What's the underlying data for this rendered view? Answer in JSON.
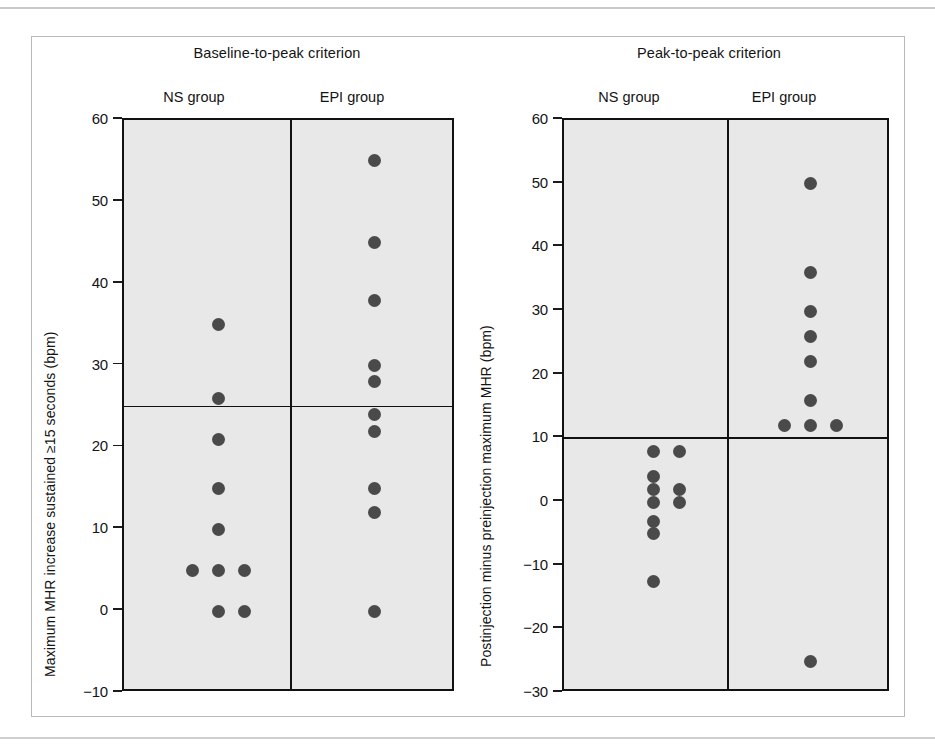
{
  "figure": {
    "panels": [
      {
        "id": "baseline-to-peak",
        "title": "Baseline-to-peak criterion",
        "axis_title": "Maximum MHR increase sustained ≥15 seconds (bpm)",
        "groups": [
          "NS group",
          "EPI group"
        ],
        "tick_labels": [
          "60",
          "50",
          "40",
          "30",
          "20",
          "10",
          "0",
          "−10"
        ],
        "threshold_label": "25"
      },
      {
        "id": "peak-to-peak",
        "title": "Peak-to-peak criterion",
        "axis_title": "Postinjection minus preinjection maximum MHR (bpm)",
        "groups": [
          "NS group",
          "EPI group"
        ],
        "tick_labels": [
          "60",
          "50",
          "40",
          "30",
          "20",
          "10",
          "0",
          "−10",
          "−20",
          "−30"
        ],
        "threshold_label": "10"
      }
    ]
  },
  "chart_data": [
    {
      "type": "scatter",
      "title": "Baseline-to-peak criterion",
      "xlabel": "",
      "ylabel": "Maximum MHR increase sustained ≥15 seconds (bpm)",
      "ylim": [
        -10,
        60
      ],
      "yticks": [
        -10,
        0,
        10,
        20,
        30,
        40,
        50,
        60
      ],
      "grid": false,
      "legend": "none",
      "threshold_line": 25,
      "categories": [
        "NS group",
        "EPI group"
      ],
      "series": [
        {
          "name": "NS group",
          "values": [
            35,
            26,
            21,
            15,
            10,
            5,
            5,
            5,
            0,
            0
          ],
          "points": [
            {
              "value": 35,
              "offset": 0
            },
            {
              "value": 26,
              "offset": 0
            },
            {
              "value": 21,
              "offset": 0
            },
            {
              "value": 15,
              "offset": 0
            },
            {
              "value": 10,
              "offset": 0
            },
            {
              "value": 5,
              "offset": -1
            },
            {
              "value": 5,
              "offset": 0
            },
            {
              "value": 5,
              "offset": 1
            },
            {
              "value": 0,
              "offset": 0
            },
            {
              "value": 0,
              "offset": 1
            }
          ]
        },
        {
          "name": "EPI group",
          "values": [
            55,
            45,
            38,
            30,
            28,
            24,
            22,
            15,
            12,
            0
          ],
          "points": [
            {
              "value": 55,
              "offset": 0
            },
            {
              "value": 45,
              "offset": 0
            },
            {
              "value": 38,
              "offset": 0
            },
            {
              "value": 30,
              "offset": 0
            },
            {
              "value": 28,
              "offset": 0
            },
            {
              "value": 24,
              "offset": 0
            },
            {
              "value": 22,
              "offset": 0
            },
            {
              "value": 15,
              "offset": 0
            },
            {
              "value": 12,
              "offset": 0
            },
            {
              "value": 0,
              "offset": 0
            }
          ]
        }
      ]
    },
    {
      "type": "scatter",
      "title": "Peak-to-peak criterion",
      "xlabel": "",
      "ylabel": "Postinjection minus preinjection maximum MHR (bpm)",
      "ylim": [
        -30,
        60
      ],
      "yticks": [
        -30,
        -20,
        -10,
        0,
        10,
        20,
        30,
        40,
        50,
        60
      ],
      "grid": false,
      "legend": "none",
      "threshold_line": 10,
      "categories": [
        "NS group",
        "EPI group"
      ],
      "series": [
        {
          "name": "NS group",
          "values": [
            8,
            8,
            4,
            2,
            2,
            0,
            0,
            -3,
            -5,
            -12.5
          ],
          "points": [
            {
              "value": 8,
              "offset": 0
            },
            {
              "value": 8,
              "offset": 1
            },
            {
              "value": 4,
              "offset": 0
            },
            {
              "value": 2,
              "offset": 0
            },
            {
              "value": 2,
              "offset": 1
            },
            {
              "value": 0,
              "offset": 0
            },
            {
              "value": 0,
              "offset": 1
            },
            {
              "value": -3,
              "offset": 0
            },
            {
              "value": -5,
              "offset": 0
            },
            {
              "value": -12.5,
              "offset": 0
            }
          ]
        },
        {
          "name": "EPI group",
          "values": [
            50,
            36,
            30,
            26,
            22,
            16,
            12,
            12,
            12,
            -25
          ],
          "points": [
            {
              "value": 50,
              "offset": 0
            },
            {
              "value": 36,
              "offset": 0
            },
            {
              "value": 30,
              "offset": 0
            },
            {
              "value": 26,
              "offset": 0
            },
            {
              "value": 22,
              "offset": 0
            },
            {
              "value": 16,
              "offset": 0
            },
            {
              "value": 12,
              "offset": -1
            },
            {
              "value": 12,
              "offset": 0
            },
            {
              "value": 12,
              "offset": 1
            },
            {
              "value": -25,
              "offset": 0
            }
          ]
        }
      ]
    }
  ]
}
